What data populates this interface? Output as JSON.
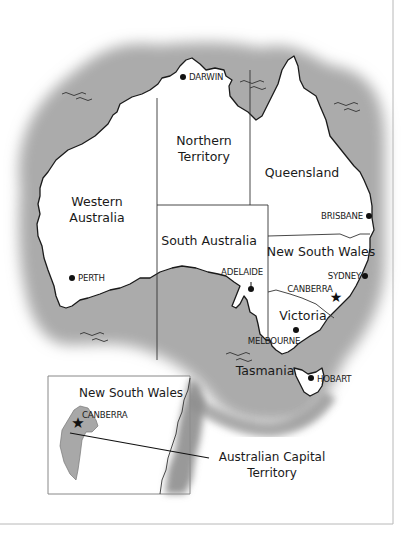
{
  "map": {
    "title": "Australia states and territories",
    "colors": {
      "land": "#ffffff",
      "sea": "#9a9a9a",
      "outline": "#1a1a1a",
      "border": "#333333",
      "frame": "#b0b0b0"
    },
    "states": [
      {
        "id": "wa",
        "label_lines": [
          "Western",
          "Australia"
        ]
      },
      {
        "id": "nt",
        "label_lines": [
          "Northern",
          "Territory"
        ]
      },
      {
        "id": "qld",
        "label_lines": [
          "Queensland"
        ]
      },
      {
        "id": "sa",
        "label_lines": [
          "South Australia"
        ]
      },
      {
        "id": "nsw",
        "label_lines": [
          "New South Wales"
        ]
      },
      {
        "id": "vic",
        "label_lines": [
          "Victoria"
        ]
      },
      {
        "id": "tas",
        "label_lines": [
          "Tasmania"
        ]
      }
    ],
    "cities": [
      {
        "id": "darwin",
        "label": "DARWIN",
        "marker": "dot"
      },
      {
        "id": "perth",
        "label": "PERTH",
        "marker": "dot"
      },
      {
        "id": "brisbane",
        "label": "BRISBANE",
        "marker": "dot"
      },
      {
        "id": "adelaide",
        "label": "ADELAIDE",
        "marker": "dot"
      },
      {
        "id": "sydney",
        "label": "SYDNEY",
        "marker": "dot"
      },
      {
        "id": "canberra",
        "label": "CANBERRA",
        "marker": "star"
      },
      {
        "id": "melbourne",
        "label": "MELBOURNE",
        "marker": "dot"
      },
      {
        "id": "hobart",
        "label": "HOBART",
        "marker": "dot"
      }
    ],
    "inset": {
      "title": "New South Wales",
      "city": {
        "label": "CANBERRA",
        "marker": "star"
      },
      "callout_lines": [
        "Australian Capital",
        "Territory"
      ]
    }
  }
}
